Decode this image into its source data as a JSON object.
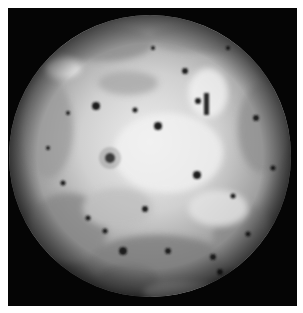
{
  "image": {
    "subject": "Io, moon of Jupiter (full disk, grayscale)",
    "background_color": "#050505",
    "border_color": "#ffffff",
    "disk": {
      "cx": 142,
      "cy": 148,
      "r": 141
    },
    "colors": {
      "surface_light": "#e8e8e8",
      "surface_mid": "#a8a8a8",
      "surface_dark": "#5a5a5a",
      "spot": "#1a1a1a"
    },
    "dark_spots": [
      {
        "x": 88,
        "y": 98,
        "r": 4
      },
      {
        "x": 150,
        "y": 118,
        "r": 4
      },
      {
        "x": 177,
        "y": 63,
        "r": 3
      },
      {
        "x": 102,
        "y": 150,
        "r": 5
      },
      {
        "x": 189,
        "y": 167,
        "r": 4
      },
      {
        "x": 127,
        "y": 102,
        "r": 2.5
      },
      {
        "x": 137,
        "y": 201,
        "r": 3
      },
      {
        "x": 248,
        "y": 110,
        "r": 3
      },
      {
        "x": 225,
        "y": 188,
        "r": 2.5
      },
      {
        "x": 115,
        "y": 243,
        "r": 4
      },
      {
        "x": 160,
        "y": 243,
        "r": 3
      },
      {
        "x": 205,
        "y": 249,
        "r": 3
      },
      {
        "x": 212,
        "y": 264,
        "r": 3
      },
      {
        "x": 55,
        "y": 175,
        "r": 2.5
      },
      {
        "x": 40,
        "y": 140,
        "r": 2
      },
      {
        "x": 265,
        "y": 160,
        "r": 2.5
      },
      {
        "x": 80,
        "y": 210,
        "r": 2.5
      },
      {
        "x": 240,
        "y": 226,
        "r": 2.5
      },
      {
        "x": 190,
        "y": 93,
        "r": 3
      },
      {
        "x": 60,
        "y": 105,
        "r": 2
      },
      {
        "x": 97,
        "y": 223,
        "r": 2.5
      },
      {
        "x": 145,
        "y": 40,
        "r": 2
      },
      {
        "x": 220,
        "y": 40,
        "r": 2
      }
    ]
  }
}
